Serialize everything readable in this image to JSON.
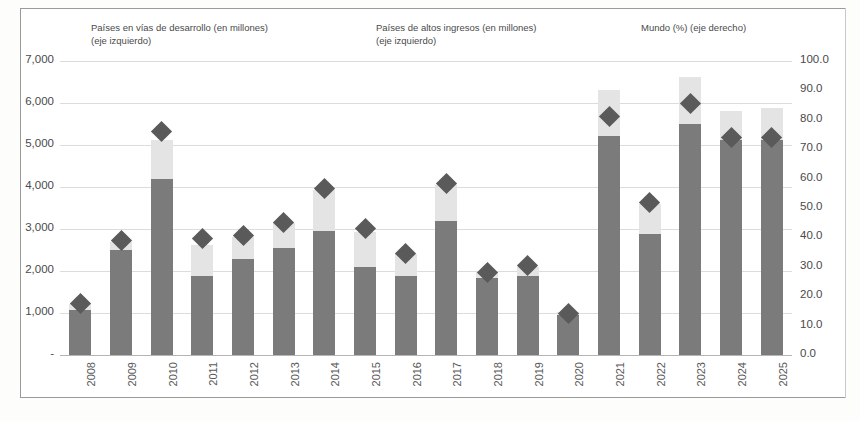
{
  "chart_data": {
    "type": "bar",
    "title": "",
    "subtitle": "",
    "xlabel": "",
    "ylabel": "",
    "grid": true,
    "legend_position": "top",
    "categories": [
      "2008",
      "2009",
      "2010",
      "2011",
      "2012",
      "2013",
      "2014",
      "2015",
      "2016",
      "2017",
      "2018",
      "2019",
      "2020",
      "2021",
      "2022",
      "2023",
      "2024",
      "2025"
    ],
    "left_axis": {
      "label": "",
      "ticks": [
        "-",
        "1,000",
        "2,000",
        "3,000",
        "4,000",
        "5,000",
        "6,000",
        "7,000"
      ],
      "tick_values": [
        0,
        1000,
        2000,
        3000,
        4000,
        5000,
        6000,
        7000
      ],
      "ylim": [
        0,
        7000
      ]
    },
    "right_axis": {
      "label": "",
      "ticks": [
        "0.0",
        "10.0",
        "20.0",
        "30.0",
        "40.0",
        "50.0",
        "60.0",
        "70.0",
        "80.0",
        "90.0",
        "100.0"
      ],
      "tick_values": [
        0,
        10,
        20,
        30,
        40,
        50,
        60,
        70,
        80,
        90,
        100
      ],
      "ylim": [
        0,
        100
      ]
    },
    "series": [
      {
        "name": "Países en vías de desarrollo (en millones) (eje izquierdo)",
        "short_name": "Países en vías de desarrollo",
        "axis": "left",
        "kind": "bar-stacked",
        "color": "#7b7b7b",
        "marker": "square",
        "values": [
          1080,
          2500,
          4200,
          1870,
          2280,
          2540,
          2960,
          2100,
          1870,
          3200,
          1840,
          1880,
          960,
          5220,
          2880,
          5500,
          5120,
          5120
        ]
      },
      {
        "name": "Países de altos ingresos (en millones) (eje izquierdo)",
        "short_name": "Países de altos ingresos",
        "axis": "left",
        "kind": "bar-stacked",
        "color": "#e4e4e4",
        "marker": "square",
        "values": [
          130,
          200,
          930,
          750,
          520,
          600,
          980,
          830,
          540,
          840,
          140,
          210,
          60,
          1080,
          710,
          1110,
          680,
          770
        ]
      },
      {
        "name": "Mundo (%) (eje derecho)",
        "short_name": "Mundo (%)",
        "axis": "right",
        "kind": "scatter",
        "color": "#5a5a5a",
        "marker": "diamond",
        "values": [
          17.5,
          39.0,
          76.0,
          39.5,
          40.5,
          45.0,
          56.5,
          43.0,
          34.5,
          58.5,
          28.0,
          30.5,
          14.0,
          81.0,
          52.0,
          85.5,
          74.0,
          74.0
        ]
      }
    ]
  },
  "legend": {
    "developing": {
      "line1": "Países en vías de desarrollo (en millones)",
      "line2": "(eje izquierdo)"
    },
    "high_income": {
      "line1": "Países de altos ingresos (en millones)",
      "line2": "(eje izquierdo)"
    },
    "world": {
      "line1": "Mundo (%) (eje derecho)",
      "line2": ""
    }
  },
  "colors": {
    "developing": "#7b7b7b",
    "high_income": "#e4e4e4",
    "world": "#5a5a5a",
    "grid": "#dcdcdc",
    "axis_text": "#4a4a4a",
    "frame": "#9a9a9a"
  }
}
